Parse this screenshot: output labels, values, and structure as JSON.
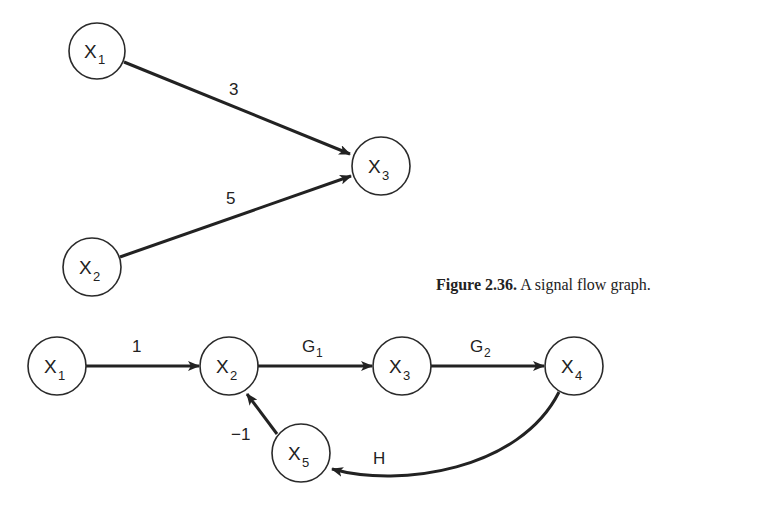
{
  "caption": {
    "number": "Figure 2.36.",
    "text": "A signal flow graph."
  },
  "graphs": [
    {
      "name": "summing-graph",
      "nodes": [
        {
          "id": "X1",
          "base": "X",
          "sub": "1"
        },
        {
          "id": "X2",
          "base": "X",
          "sub": "2"
        },
        {
          "id": "X3",
          "base": "X",
          "sub": "3"
        }
      ],
      "edges": [
        {
          "from": "X1",
          "to": "X3",
          "gain": "3"
        },
        {
          "from": "X2",
          "to": "X3",
          "gain": "5"
        }
      ]
    },
    {
      "name": "feedback-graph",
      "nodes": [
        {
          "id": "X1",
          "base": "X",
          "sub": "1"
        },
        {
          "id": "X2",
          "base": "X",
          "sub": "2"
        },
        {
          "id": "X3",
          "base": "X",
          "sub": "3"
        },
        {
          "id": "X4",
          "base": "X",
          "sub": "4"
        },
        {
          "id": "X5",
          "base": "X",
          "sub": "5"
        }
      ],
      "edges": [
        {
          "from": "X1",
          "to": "X2",
          "gain": "1",
          "gain_sub": ""
        },
        {
          "from": "X2",
          "to": "X3",
          "gain": "G",
          "gain_sub": "1"
        },
        {
          "from": "X3",
          "to": "X4",
          "gain": "G",
          "gain_sub": "2"
        },
        {
          "from": "X4",
          "to": "X5",
          "gain": "H",
          "gain_sub": ""
        },
        {
          "from": "X5",
          "to": "X2",
          "gain": "−1",
          "gain_sub": ""
        }
      ]
    }
  ]
}
